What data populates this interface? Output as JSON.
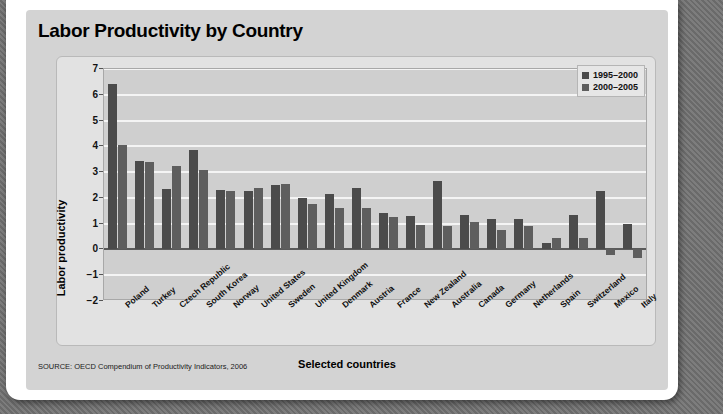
{
  "figure": {
    "title": "Labor Productivity by Country",
    "source": "SOURCE: OECD Compendium of Productivity Indicators, 2006"
  },
  "chart_data": {
    "type": "bar",
    "title": "Labor Productivity by Country",
    "xlabel": "Selected countries",
    "ylabel": "Labor productivity",
    "ylim": [
      -2,
      7
    ],
    "yticks": [
      7,
      6,
      5,
      4,
      3,
      2,
      1,
      0,
      -1,
      -2
    ],
    "grid": true,
    "legend_position": "top-right",
    "categories": [
      "Poland",
      "Turkey",
      "Czech Republic",
      "South Korea",
      "Norway",
      "United States",
      "Sweden",
      "United Kingdom",
      "Denmark",
      "Austria",
      "France",
      "New Zealand",
      "Australia",
      "Canada",
      "Germany",
      "Netherlands",
      "Spain",
      "Switzerland",
      "Mexico",
      "Italy"
    ],
    "series": [
      {
        "name": "1995–2000",
        "color": "#4b4b4b",
        "values": [
          6.4,
          3.45,
          2.35,
          3.85,
          2.3,
          2.25,
          2.5,
          2.0,
          2.15,
          2.4,
          1.4,
          1.3,
          2.65,
          1.35,
          1.2,
          1.2,
          0.25,
          1.35,
          2.25,
          1.0
        ]
      },
      {
        "name": "2000–2005",
        "color": "#5e5e5e",
        "values": [
          4.05,
          3.4,
          3.25,
          3.1,
          2.25,
          2.4,
          2.55,
          1.75,
          1.6,
          1.6,
          1.25,
          0.95,
          0.9,
          1.05,
          0.75,
          0.9,
          0.45,
          0.45,
          -0.2,
          -0.35
        ]
      }
    ]
  },
  "legend": {
    "items": [
      {
        "label": "1995–2000"
      },
      {
        "label": "2000–2005"
      }
    ]
  }
}
